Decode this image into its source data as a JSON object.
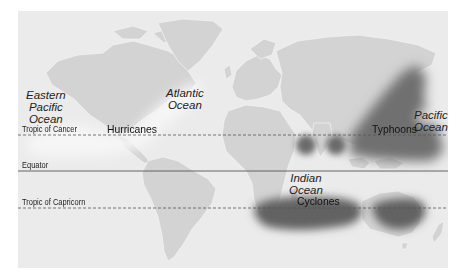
{
  "map": {
    "title": "Tropical cyclone regions world map",
    "colors": {
      "background": "#ebebeb",
      "land": "#d3d3d3",
      "border": "#f4f4f4",
      "storm_dark": "#6a6a6a",
      "storm_light": "#f7f7f7",
      "line": "#555555"
    },
    "lines": [
      {
        "id": "cancer",
        "label": "Tropic of Cancer",
        "style": "dashed"
      },
      {
        "id": "equator",
        "label": "Equator",
        "style": "solid"
      },
      {
        "id": "capricorn",
        "label": "Tropic of Capricorn",
        "style": "dashed"
      }
    ],
    "oceans": [
      {
        "id": "eastern-pacific",
        "label": "Eastern Pacific Ocean",
        "line1": "Eastern",
        "line2": "Pacific",
        "line3": "Ocean"
      },
      {
        "id": "atlantic",
        "label": "Atlantic Ocean",
        "line1": "Atlantic",
        "line2": "Ocean"
      },
      {
        "id": "indian",
        "label": "Indian Ocean",
        "line1": "Indian",
        "line2": "Ocean"
      },
      {
        "id": "pacific",
        "label": "Pacific Ocean",
        "line1": "Pacific",
        "line2": "Ocean"
      }
    ],
    "storm_regions": [
      {
        "id": "hurricanes",
        "label": "Hurricanes"
      },
      {
        "id": "typhoons",
        "label": "Typhoons"
      },
      {
        "id": "cyclones",
        "label": "Cyclones"
      }
    ]
  }
}
